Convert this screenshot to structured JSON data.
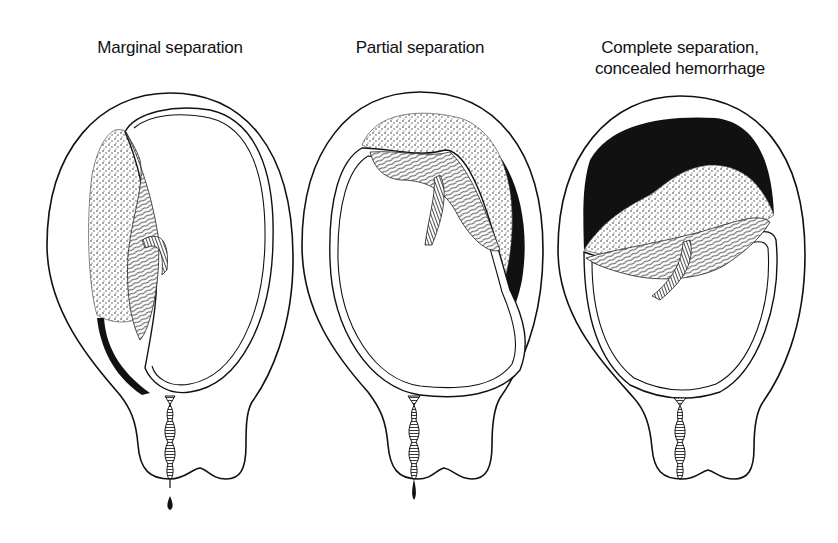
{
  "figure": {
    "panels": [
      {
        "id": "marginal",
        "label": "Marginal separation",
        "bleeding": "external",
        "hemorrhage_fill": "thin dark band along left wall"
      },
      {
        "id": "partial",
        "label": "Partial separation",
        "bleeding": "external",
        "hemorrhage_fill": "dark crescent on upper-right wall"
      },
      {
        "id": "complete",
        "label_line1": "Complete separation,",
        "label_line2": "concealed hemorrhage",
        "bleeding": "concealed",
        "hemorrhage_fill": "large dark clot at fundus"
      }
    ],
    "colors": {
      "ink": "#111111",
      "background": "#ffffff",
      "placenta_stipple": "#555555"
    }
  }
}
